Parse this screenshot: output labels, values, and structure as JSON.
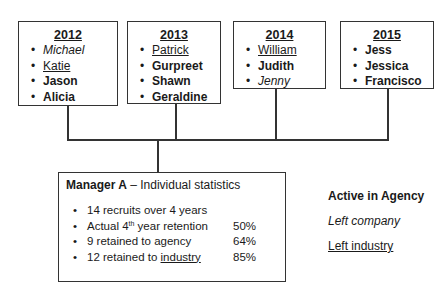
{
  "years": [
    {
      "year": "2012",
      "names": [
        {
          "name": "Michael",
          "style": "italic"
        },
        {
          "name": "Katie",
          "style": "underline"
        },
        {
          "name": "Jason",
          "style": "bold"
        },
        {
          "name": "Alicia",
          "style": "bold"
        }
      ]
    },
    {
      "year": "2013",
      "names": [
        {
          "name": "Patrick",
          "style": "underline"
        },
        {
          "name": "Gurpreet",
          "style": "bold"
        },
        {
          "name": "Shawn",
          "style": "bold"
        },
        {
          "name": "Geraldine",
          "style": "bold"
        }
      ]
    },
    {
      "year": "2014",
      "names": [
        {
          "name": "William",
          "style": "underline"
        },
        {
          "name": "Judith",
          "style": "bold"
        },
        {
          "name": "Jenny",
          "style": "italic"
        }
      ]
    },
    {
      "year": "2015",
      "names": [
        {
          "name": "Jess",
          "style": "bold"
        },
        {
          "name": "Jessica",
          "style": "bold"
        },
        {
          "name": "Francisco",
          "style": "bold"
        }
      ]
    }
  ],
  "stats": {
    "title_bold": "Manager A",
    "title_rest": " – Individual statistics",
    "items": [
      {
        "text": "14 recruits over 4 years",
        "value": ""
      },
      {
        "text_pre": "Actual 4",
        "sup": "th",
        "text_post": " year retention",
        "value": "50%"
      },
      {
        "text": "9 retained to agency",
        "value": "64%"
      },
      {
        "text_pre": "12 retained to ",
        "underlined": "industry",
        "value": "85%"
      }
    ]
  },
  "legend": {
    "active": "Active in Agency",
    "left_company": "Left company",
    "left_industry": "Left industry"
  }
}
